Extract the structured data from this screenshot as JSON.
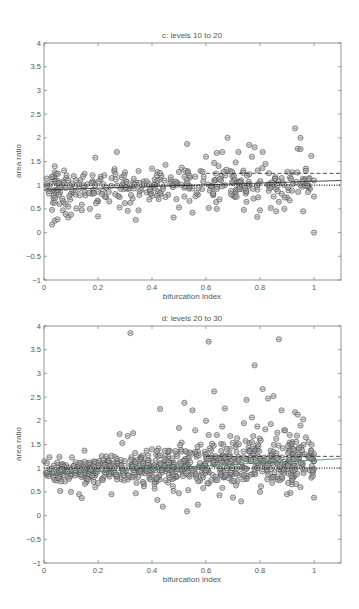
{
  "chart_data": [
    {
      "type": "scatter",
      "title": "c:  levels 10 to 20",
      "xlabel": "bifurcation index",
      "ylabel": "area ratio",
      "xlim": [
        0,
        1.1
      ],
      "ylim": [
        -1,
        4
      ],
      "xticks": [
        "0",
        "0.2",
        "0.4",
        "0.6",
        "0.8",
        "1"
      ],
      "yticks": [
        "-1",
        "-0.5",
        "0",
        "0.5",
        "1",
        "1.5",
        "2",
        "2.5",
        "3",
        "3.5",
        "4"
      ],
      "grid": false,
      "reference_lines": [
        {
          "name": "dotted",
          "style": "dotted",
          "y_start": 1.0,
          "y_end": 1.0
        },
        {
          "name": "solid fit",
          "style": "solid",
          "y_start": 0.9,
          "y_end": 1.1
        },
        {
          "name": "dashed",
          "style": "dashed",
          "x_start": 0.6,
          "y_start": 1.25,
          "y_end": 1.25
        }
      ],
      "points": [
        [
          0.01,
          1.02
        ],
        [
          0.02,
          0.98
        ],
        [
          0.03,
          0.17
        ],
        [
          0.03,
          0.48
        ],
        [
          0.04,
          1.4
        ],
        [
          0.04,
          1.27
        ],
        [
          0.04,
          0.25
        ],
        [
          0.05,
          0.28
        ],
        [
          0.05,
          0.88
        ],
        [
          0.06,
          0.85
        ],
        [
          0.07,
          1.0
        ],
        [
          0.07,
          0.47
        ],
        [
          0.08,
          0.39
        ],
        [
          0.08,
          0.6
        ],
        [
          0.09,
          0.32
        ],
        [
          0.09,
          0.55
        ],
        [
          0.1,
          0.38
        ],
        [
          0.1,
          0.82
        ],
        [
          0.11,
          1.19
        ],
        [
          0.11,
          0.85
        ],
        [
          0.12,
          0.51
        ],
        [
          0.13,
          1.03
        ],
        [
          0.13,
          0.92
        ],
        [
          0.14,
          0.47
        ],
        [
          0.14,
          0.59
        ],
        [
          0.15,
          1.24
        ],
        [
          0.15,
          0.96
        ],
        [
          0.16,
          1.02
        ],
        [
          0.17,
          0.5
        ],
        [
          0.18,
          0.9
        ],
        [
          0.19,
          1.58
        ],
        [
          0.2,
          0.34
        ],
        [
          0.2,
          0.66
        ],
        [
          0.21,
          1.18
        ],
        [
          0.22,
          1.02
        ],
        [
          0.23,
          0.95
        ],
        [
          0.24,
          0.86
        ],
        [
          0.25,
          1.15
        ],
        [
          0.26,
          1.3
        ],
        [
          0.27,
          1.7
        ],
        [
          0.28,
          0.53
        ],
        [
          0.28,
          0.75
        ],
        [
          0.29,
          1.0
        ],
        [
          0.3,
          0.62
        ],
        [
          0.3,
          1.27
        ],
        [
          0.31,
          0.46
        ],
        [
          0.32,
          0.63
        ],
        [
          0.33,
          1.05
        ],
        [
          0.34,
          0.27
        ],
        [
          0.35,
          1.3
        ],
        [
          0.35,
          0.47
        ],
        [
          0.36,
          0.9
        ],
        [
          0.37,
          1.08
        ],
        [
          0.38,
          0.85
        ],
        [
          0.39,
          0.7
        ],
        [
          0.4,
          1.35
        ],
        [
          0.41,
          1.0
        ],
        [
          0.42,
          0.78
        ],
        [
          0.43,
          1.12
        ],
        [
          0.44,
          0.92
        ],
        [
          0.45,
          1.43
        ],
        [
          0.46,
          0.8
        ],
        [
          0.47,
          1.1
        ],
        [
          0.48,
          0.32
        ],
        [
          0.49,
          1.0
        ],
        [
          0.5,
          0.53
        ],
        [
          0.5,
          1.28
        ],
        [
          0.51,
          1.37
        ],
        [
          0.52,
          0.76
        ],
        [
          0.53,
          1.87
        ],
        [
          0.54,
          0.95
        ],
        [
          0.55,
          0.42
        ],
        [
          0.56,
          1.18
        ],
        [
          0.57,
          0.8
        ],
        [
          0.58,
          1.3
        ],
        [
          0.59,
          1.08
        ],
        [
          0.6,
          1.6
        ],
        [
          0.61,
          0.52
        ],
        [
          0.62,
          0.98
        ],
        [
          0.63,
          1.47
        ],
        [
          0.64,
          1.68
        ],
        [
          0.64,
          0.5
        ],
        [
          0.65,
          0.7
        ],
        [
          0.66,
          1.7
        ],
        [
          0.67,
          1.0
        ],
        [
          0.68,
          2.0
        ],
        [
          0.69,
          1.3
        ],
        [
          0.7,
          0.78
        ],
        [
          0.71,
          1.48
        ],
        [
          0.72,
          1.7
        ],
        [
          0.73,
          1.1
        ],
        [
          0.74,
          0.48
        ],
        [
          0.75,
          0.65
        ],
        [
          0.76,
          1.85
        ],
        [
          0.77,
          1.6
        ],
        [
          0.78,
          1.8
        ],
        [
          0.79,
          0.33
        ],
        [
          0.8,
          0.47
        ],
        [
          0.81,
          1.7
        ],
        [
          0.82,
          1.45
        ],
        [
          0.83,
          1.0
        ],
        [
          0.84,
          0.52
        ],
        [
          0.85,
          1.05
        ],
        [
          0.86,
          0.45
        ],
        [
          0.87,
          0.65
        ],
        [
          0.88,
          1.15
        ],
        [
          0.89,
          0.5
        ],
        [
          0.9,
          0.74
        ],
        [
          0.91,
          0.68
        ],
        [
          0.92,
          1.27
        ],
        [
          0.93,
          2.2
        ],
        [
          0.94,
          1.77
        ],
        [
          0.95,
          2.0
        ],
        [
          0.95,
          1.76
        ],
        [
          0.96,
          0.45
        ],
        [
          0.97,
          1.35
        ],
        [
          0.98,
          0.95
        ],
        [
          0.99,
          1.62
        ],
        [
          1.0,
          1.1
        ],
        [
          1.0,
          0.0
        ],
        [
          1.0,
          0.76
        ]
      ]
    },
    {
      "type": "scatter",
      "title": "d:  levels 20 to 30",
      "xlabel": "bifurcation index",
      "ylabel": "area ratio",
      "xlim": [
        0,
        1.1
      ],
      "ylim": [
        -1,
        4
      ],
      "xticks": [
        "0",
        "0.2",
        "0.4",
        "0.6",
        "0.8",
        "1"
      ],
      "yticks": [
        "-1",
        "-0.5",
        "0",
        "0.5",
        "1",
        "1.5",
        "2",
        "2.5",
        "3",
        "3.5",
        "4"
      ],
      "grid": false,
      "reference_lines": [
        {
          "name": "dotted",
          "style": "dotted",
          "y_start": 1.0,
          "y_end": 1.0
        },
        {
          "name": "solid fit",
          "style": "solid",
          "color": "#3a8a4a",
          "y_start": 0.87,
          "y_end": 1.2
        },
        {
          "name": "dashed",
          "style": "dashed",
          "x_start": 0.6,
          "y_start": 1.25,
          "y_end": 1.25
        }
      ],
      "points": [
        [
          0.02,
          1.23
        ],
        [
          0.02,
          0.98
        ],
        [
          0.03,
          0.9
        ],
        [
          0.05,
          1.06
        ],
        [
          0.06,
          0.52
        ],
        [
          0.07,
          0.85
        ],
        [
          0.08,
          0.98
        ],
        [
          0.1,
          0.5
        ],
        [
          0.11,
          1.05
        ],
        [
          0.13,
          0.45
        ],
        [
          0.14,
          0.37
        ],
        [
          0.15,
          1.37
        ],
        [
          0.16,
          1.0
        ],
        [
          0.17,
          0.82
        ],
        [
          0.19,
          0.6
        ],
        [
          0.2,
          1.05
        ],
        [
          0.22,
          0.8
        ],
        [
          0.23,
          1.25
        ],
        [
          0.24,
          0.98
        ],
        [
          0.25,
          0.45
        ],
        [
          0.26,
          0.9
        ],
        [
          0.27,
          1.2
        ],
        [
          0.28,
          1.72
        ],
        [
          0.29,
          1.53
        ],
        [
          0.3,
          1.15
        ],
        [
          0.31,
          1.68
        ],
        [
          0.32,
          3.85
        ],
        [
          0.33,
          1.74
        ],
        [
          0.34,
          0.47
        ],
        [
          0.35,
          0.93
        ],
        [
          0.36,
          1.23
        ],
        [
          0.37,
          0.62
        ],
        [
          0.38,
          1.37
        ],
        [
          0.39,
          0.85
        ],
        [
          0.4,
          1.4
        ],
        [
          0.41,
          0.57
        ],
        [
          0.42,
          0.33
        ],
        [
          0.43,
          2.25
        ],
        [
          0.44,
          0.19
        ],
        [
          0.45,
          1.0
        ],
        [
          0.46,
          0.7
        ],
        [
          0.47,
          1.12
        ],
        [
          0.48,
          0.52
        ],
        [
          0.49,
          1.3
        ],
        [
          0.5,
          1.85
        ],
        [
          0.5,
          0.47
        ],
        [
          0.51,
          1.54
        ],
        [
          0.52,
          2.38
        ],
        [
          0.53,
          0.09
        ],
        [
          0.54,
          1.0
        ],
        [
          0.55,
          2.22
        ],
        [
          0.56,
          1.8
        ],
        [
          0.57,
          0.23
        ],
        [
          0.58,
          1.5
        ],
        [
          0.59,
          0.58
        ],
        [
          0.6,
          2.0
        ],
        [
          0.61,
          3.67
        ],
        [
          0.61,
          1.7
        ],
        [
          0.62,
          0.75
        ],
        [
          0.63,
          2.62
        ],
        [
          0.64,
          1.7
        ],
        [
          0.65,
          0.43
        ],
        [
          0.66,
          1.88
        ],
        [
          0.67,
          2.26
        ],
        [
          0.68,
          1.0
        ],
        [
          0.69,
          1.68
        ],
        [
          0.7,
          0.38
        ],
        [
          0.71,
          1.45
        ],
        [
          0.72,
          0.85
        ],
        [
          0.73,
          0.3
        ],
        [
          0.74,
          1.95
        ],
        [
          0.75,
          2.44
        ],
        [
          0.76,
          1.53
        ],
        [
          0.77,
          2.07
        ],
        [
          0.78,
          3.17
        ],
        [
          0.79,
          1.88
        ],
        [
          0.8,
          0.5
        ],
        [
          0.81,
          2.67
        ],
        [
          0.82,
          1.82
        ],
        [
          0.83,
          2.47
        ],
        [
          0.84,
          1.93
        ],
        [
          0.85,
          2.52
        ],
        [
          0.86,
          1.62
        ],
        [
          0.87,
          3.72
        ],
        [
          0.88,
          2.22
        ],
        [
          0.89,
          1.8
        ],
        [
          0.9,
          0.45
        ],
        [
          0.91,
          1.7
        ],
        [
          0.92,
          1.55
        ],
        [
          0.93,
          2.18
        ],
        [
          0.94,
          2.13
        ],
        [
          0.95,
          1.9
        ],
        [
          0.96,
          2.03
        ],
        [
          0.97,
          1.65
        ],
        [
          0.98,
          1.55
        ],
        [
          0.99,
          0.8
        ],
        [
          1.0,
          1.15
        ],
        [
          1.0,
          0.38
        ],
        [
          1.0,
          1.3
        ],
        [
          0.95,
          0.6
        ]
      ]
    }
  ]
}
